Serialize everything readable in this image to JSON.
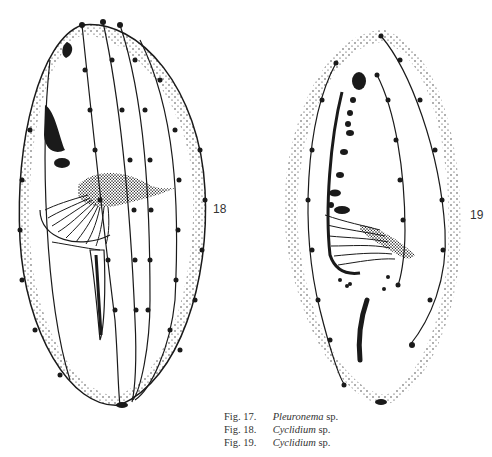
{
  "figures": [
    {
      "number": "18",
      "label": "18",
      "description": "Ciliate drawing with stippled cortex, beaded kineties, dark oral membrane and fan of cilia"
    },
    {
      "number": "19",
      "label": "19",
      "description": "Ciliate drawing with stippled margin, beaded kineties, macronuclear fragments and oral cilia"
    }
  ],
  "captions": [
    {
      "fig": "Fig. 17.",
      "genus": "Pleuronema",
      "species": "sp."
    },
    {
      "fig": "Fig. 18.",
      "genus": "Cyclidium",
      "species": "sp."
    },
    {
      "fig": "Fig. 19.",
      "genus": "Cyclidium",
      "species": "sp."
    }
  ],
  "colors": {
    "ink": "#1a1a1a",
    "paper": "#ffffff"
  }
}
